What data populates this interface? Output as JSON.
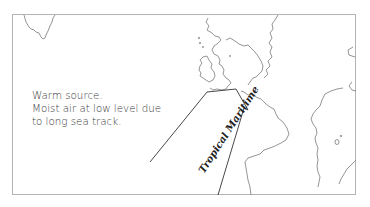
{
  "diagram": {
    "type": "air-mass-map",
    "caption_lines": [
      "Warm source.",
      "Moist air at low level due",
      "to long sea track."
    ],
    "air_mass_label": "Tropical Maritime",
    "colors": {
      "outline": "#6e6e6e",
      "frame": "#b4b4b4",
      "arrow": "#333333",
      "text": "#3a3a3a"
    }
  }
}
